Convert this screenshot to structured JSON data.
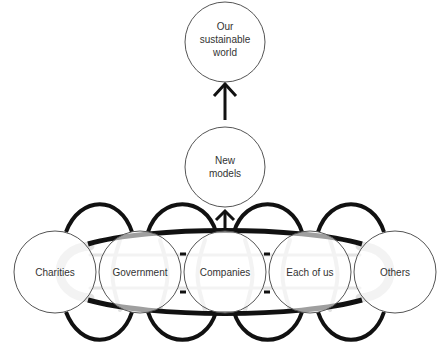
{
  "diagram": {
    "top_node": {
      "lines": [
        "Our",
        "sustainable",
        "world"
      ]
    },
    "middle_node": {
      "lines": [
        "New",
        "models"
      ]
    },
    "bottom_nodes": [
      {
        "label": "Charities"
      },
      {
        "label": "Government"
      },
      {
        "label": "Companies"
      },
      {
        "label": "Each of us"
      },
      {
        "label": "Others"
      }
    ],
    "colors": {
      "stroke": "#111111",
      "circle_stroke": "#555555",
      "ghost": "#e2e2e2",
      "text": "#333333"
    }
  }
}
